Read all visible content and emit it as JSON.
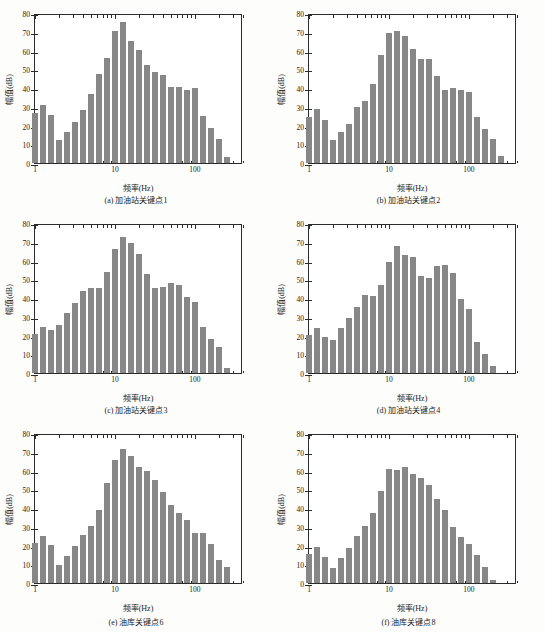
{
  "figure": {
    "panel_count": 6,
    "bar_color": "#878787",
    "axis_color": "#2b2b2b",
    "background": "#fdfdfb"
  },
  "chart_data": [
    {
      "type": "bar",
      "id": "panel-a",
      "title": "(a) 加油站关键点1",
      "xlabel": "频率(Hz)",
      "ylabel": "幅值(dB)",
      "ylim": [
        0,
        80
      ],
      "yticks": [
        0,
        10,
        20,
        30,
        40,
        50,
        60,
        70,
        80
      ],
      "xlim": [
        1,
        400
      ],
      "xscale": "log",
      "xticks": [
        1,
        10,
        100
      ],
      "xticklabels": [
        "1",
        "10",
        "100"
      ],
      "grid": false,
      "x": [
        1.0,
        1.26,
        1.58,
        2.0,
        2.51,
        3.16,
        3.98,
        5.01,
        6.31,
        7.94,
        10.0,
        12.6,
        15.8,
        20.0,
        25.1,
        31.6,
        39.8,
        50.1,
        63.1,
        79.4,
        100.0,
        126.0,
        158.0,
        200.0,
        251.0
      ],
      "values": [
        26.5,
        30.8,
        25.4,
        12.3,
        16.5,
        21.8,
        28.5,
        36.9,
        47.6,
        55.9,
        70.2,
        75.2,
        65.3,
        60.4,
        52.1,
        48.4,
        47.2,
        40.6,
        40.4,
        38.7,
        39.8,
        24.9,
        18.5,
        13.0,
        3.2
      ]
    },
    {
      "type": "bar",
      "id": "panel-b",
      "title": "(b) 加油站关键点2",
      "xlabel": "频率(Hz)",
      "ylabel": "幅值(dB)",
      "ylim": [
        0,
        80
      ],
      "yticks": [
        0,
        10,
        20,
        30,
        40,
        50,
        60,
        70,
        80
      ],
      "xlim": [
        1,
        400
      ],
      "xscale": "log",
      "xticks": [
        1,
        10,
        100
      ],
      "xticklabels": [
        "1",
        "10",
        "100"
      ],
      "grid": false,
      "x": [
        1.0,
        1.26,
        1.58,
        2.0,
        2.51,
        3.16,
        3.98,
        5.01,
        6.31,
        7.94,
        10.0,
        12.6,
        15.8,
        20.0,
        25.1,
        31.6,
        39.8,
        50.1,
        63.1,
        79.4,
        100.0,
        126.0,
        158.0,
        200.0,
        251.0
      ],
      "values": [
        24.6,
        28.7,
        23.2,
        12.2,
        16.4,
        21.0,
        29.8,
        33.3,
        42.1,
        57.6,
        69.4,
        70.2,
        67.5,
        61.0,
        55.5,
        55.5,
        46.2,
        39.0,
        40.0,
        39.1,
        38.1,
        24.8,
        18.4,
        12.7,
        3.6
      ]
    },
    {
      "type": "bar",
      "id": "panel-c",
      "title": "(c) 加油站关键点3",
      "xlabel": "频率(Hz)",
      "ylabel": "幅值(dB)",
      "ylim": [
        0,
        80
      ],
      "yticks": [
        0,
        10,
        20,
        30,
        40,
        50,
        60,
        70,
        80
      ],
      "xlim": [
        1,
        400
      ],
      "xscale": "log",
      "xticks": [
        1,
        10,
        100
      ],
      "xticklabels": [
        "1",
        "10",
        "100"
      ],
      "grid": false,
      "x": [
        1.0,
        1.26,
        1.58,
        2.0,
        2.51,
        3.16,
        3.98,
        5.01,
        6.31,
        7.94,
        10.0,
        12.6,
        15.8,
        20.0,
        25.1,
        31.6,
        39.8,
        50.1,
        63.1,
        79.4,
        100.0,
        126.0,
        158.0,
        200.0,
        251.0
      ],
      "values": [
        21.0,
        24.6,
        23.2,
        25.6,
        32.2,
        37.6,
        43.5,
        45.2,
        45.2,
        53.9,
        66.2,
        72.6,
        69.1,
        63.3,
        52.6,
        45.1,
        45.8,
        48.1,
        46.9,
        40.5,
        38.1,
        24.4,
        18.3,
        13.8,
        2.5
      ]
    },
    {
      "type": "bar",
      "id": "panel-d",
      "title": "(d) 加油站关键点4",
      "xlabel": "频率(Hz)",
      "ylabel": "幅值(dB)",
      "ylim": [
        0,
        80
      ],
      "yticks": [
        0,
        10,
        20,
        30,
        40,
        50,
        60,
        70,
        80
      ],
      "xlim": [
        1,
        400
      ],
      "xscale": "log",
      "xticks": [
        1,
        10,
        100
      ],
      "xticklabels": [
        "1",
        "10",
        "100"
      ],
      "grid": false,
      "x": [
        1.0,
        1.26,
        1.58,
        2.0,
        2.51,
        3.16,
        3.98,
        5.01,
        6.31,
        7.94,
        10.0,
        12.6,
        15.8,
        20.0,
        25.1,
        31.6,
        39.8,
        50.1,
        63.1,
        79.4,
        100.0,
        126.0,
        158.0,
        200.0,
        251.0
      ],
      "values": [
        20.5,
        23.9,
        19.0,
        17.8,
        23.9,
        29.4,
        35.2,
        41.5,
        41.3,
        47.2,
        59.4,
        67.9,
        62.8,
        61.9,
        51.5,
        50.7,
        57.3,
        57.4,
        53.3,
        39.5,
        34.3,
        16.6,
        10.0,
        3.7,
        0.0
      ]
    },
    {
      "type": "bar",
      "id": "panel-e",
      "title": "(e) 油库关键点6",
      "xlabel": "频率(Hz)",
      "ylabel": "幅值(dB)",
      "ylim": [
        0,
        80
      ],
      "yticks": [
        0,
        10,
        20,
        30,
        40,
        50,
        60,
        70,
        80
      ],
      "xlim": [
        1,
        400
      ],
      "xscale": "log",
      "xticks": [
        1,
        10,
        100
      ],
      "xticklabels": [
        "1",
        "10",
        "100"
      ],
      "grid": false,
      "x": [
        1.0,
        1.26,
        1.58,
        2.0,
        2.51,
        3.16,
        3.98,
        5.01,
        6.31,
        7.94,
        10.0,
        12.6,
        15.8,
        20.0,
        25.1,
        31.6,
        39.8,
        50.1,
        63.1,
        79.4,
        100.0,
        126.0,
        158.0,
        200.0,
        251.0
      ],
      "values": [
        21.4,
        25.3,
        20.4,
        9.4,
        14.4,
        19.9,
        25.6,
        30.6,
        38.9,
        53.6,
        65.8,
        71.7,
        68.0,
        61.8,
        59.8,
        54.9,
        48.7,
        41.7,
        37.6,
        33.4,
        26.8,
        26.5,
        20.6,
        12.4,
        8.8
      ]
    },
    {
      "type": "bar",
      "id": "panel-f",
      "title": "(f) 油库关键点8",
      "xlabel": "频率(Hz)",
      "ylabel": "幅值(dB)",
      "ylim": [
        0,
        80
      ],
      "yticks": [
        0,
        10,
        20,
        30,
        40,
        50,
        60,
        70,
        80
      ],
      "xlim": [
        1,
        400
      ],
      "xscale": "log",
      "xticks": [
        1,
        10,
        100
      ],
      "xticklabels": [
        "1",
        "10",
        "100"
      ],
      "grid": false,
      "x": [
        1.0,
        1.26,
        1.58,
        2.0,
        2.51,
        3.16,
        3.98,
        5.01,
        6.31,
        7.94,
        10.0,
        12.6,
        15.8,
        20.0,
        25.1,
        31.6,
        39.8,
        50.1,
        63.1,
        79.4,
        100.0,
        126.0,
        158.0,
        200.0,
        251.0
      ],
      "values": [
        15.3,
        19.0,
        13.8,
        7.8,
        13.4,
        18.5,
        25.2,
        30.3,
        37.5,
        48.9,
        60.8,
        60.5,
        61.7,
        58.3,
        56.1,
        52.4,
        45.0,
        38.9,
        30.1,
        24.6,
        20.9,
        14.7,
        8.6,
        1.5,
        0.0
      ]
    }
  ]
}
